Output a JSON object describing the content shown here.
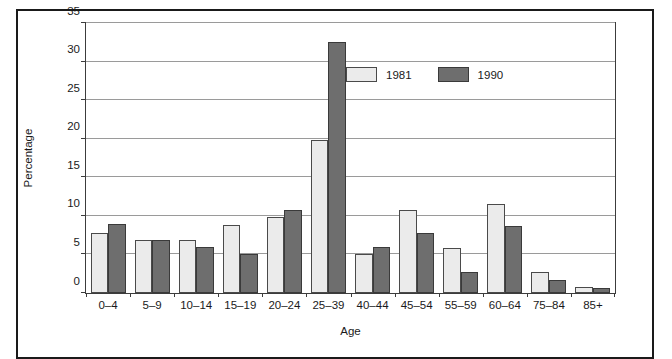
{
  "chart_data": {
    "type": "bar",
    "title": "",
    "xlabel": "Age",
    "ylabel": "Percentage",
    "ylim": [
      0,
      35
    ],
    "ytick_values": [
      0,
      5,
      10,
      15,
      20,
      25,
      30,
      35
    ],
    "ytick_labels": [
      "0",
      "5",
      "10",
      "15",
      "20",
      "25",
      "30",
      "35"
    ],
    "grid": true,
    "legend_position": "upper right inside",
    "categories": [
      "0–4",
      "5–9",
      "10–14",
      "15–19",
      "20–24",
      "25–39",
      "40–44",
      "45–54",
      "55–59",
      "60–64",
      "75–84",
      "85+"
    ],
    "series": [
      {
        "name": "1981",
        "color": "#ebebeb",
        "values": [
          7.8,
          6.9,
          6.9,
          8.8,
          9.8,
          19.8,
          5.0,
          10.7,
          5.8,
          11.5,
          2.7,
          0.8
        ]
      },
      {
        "name": "1990",
        "color": "#6e6e6e",
        "values": [
          8.9,
          6.9,
          6.0,
          5.0,
          10.8,
          32.6,
          6.0,
          7.8,
          2.7,
          8.7,
          1.7,
          0.7
        ]
      }
    ]
  },
  "legend": {
    "items": [
      {
        "label": "1981",
        "swatch": "light-gray-swatch"
      },
      {
        "label": "1990",
        "swatch": "dark-gray-swatch"
      }
    ]
  },
  "axes": {
    "y_title": "Percentage",
    "x_title": "Age"
  },
  "colors": {
    "series_1981": "#ebebeb",
    "series_1990": "#6e6e6e",
    "gridline": "#9a9a9a",
    "axis": "#3c3c3c",
    "frame": "#1a1a1a",
    "background": "#ffffff"
  }
}
